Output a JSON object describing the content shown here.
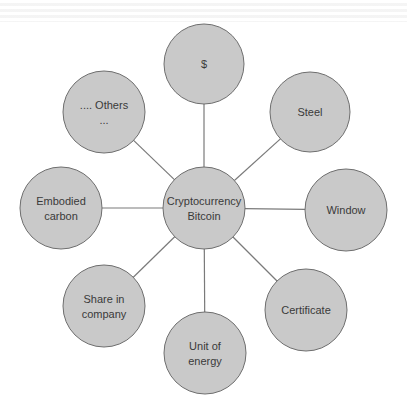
{
  "diagram": {
    "type": "hub-and-spoke",
    "colors": {
      "node_fill": "#c9c9c9",
      "node_stroke": "#6e6e6e",
      "edge": "#7a7a7a",
      "text": "#3a3a3a",
      "background": "#ffffff"
    },
    "center": {
      "id": "center",
      "lines": [
        "Cryptocurrency",
        "Bitcoin"
      ],
      "cx": 204,
      "cy": 208,
      "r": 41
    },
    "nodes": [
      {
        "id": "dollar",
        "lines": [
          "$"
        ],
        "cx": 204,
        "cy": 64,
        "r": 40
      },
      {
        "id": "steel",
        "lines": [
          "Steel"
        ],
        "cx": 310,
        "cy": 112,
        "r": 40
      },
      {
        "id": "window",
        "lines": [
          "Window"
        ],
        "cx": 346,
        "cy": 210,
        "r": 41
      },
      {
        "id": "certificate",
        "lines": [
          "Certificate"
        ],
        "cx": 306,
        "cy": 310,
        "r": 41
      },
      {
        "id": "unit-of-energy",
        "lines": [
          "Unit of",
          "energy"
        ],
        "cx": 205,
        "cy": 353,
        "r": 41
      },
      {
        "id": "share-in-company",
        "lines": [
          "Share in",
          "company"
        ],
        "cx": 104,
        "cy": 306,
        "r": 41
      },
      {
        "id": "embodied-carbon",
        "lines": [
          "Embodied",
          "carbon"
        ],
        "cx": 61,
        "cy": 208,
        "r": 41
      },
      {
        "id": "others",
        "lines": [
          ".... Others",
          "..."
        ],
        "cx": 104,
        "cy": 112,
        "r": 41
      }
    ]
  }
}
